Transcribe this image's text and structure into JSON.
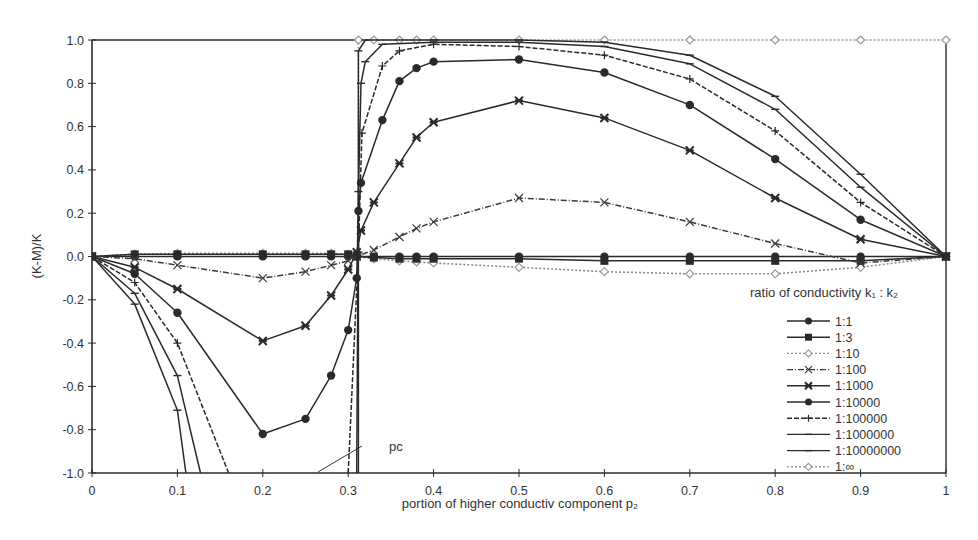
{
  "chart_data": {
    "type": "line",
    "title": "",
    "xlabel": "portion of higher conductiv component  p₂",
    "ylabel": "(K-M)/K",
    "xlim": [
      0,
      1
    ],
    "ylim": [
      -1.0,
      1.0
    ],
    "grid": false,
    "x_ticks": [
      {
        "v": 0,
        "label": "0"
      },
      {
        "v": 0.1,
        "label": "0.1"
      },
      {
        "v": 0.2,
        "label": "0.2"
      },
      {
        "v": 0.3,
        "label": "0.3"
      },
      {
        "v": 0.4,
        "label": "0.4"
      },
      {
        "v": 0.5,
        "label": "0.5"
      },
      {
        "v": 0.6,
        "label": "0.6"
      },
      {
        "v": 0.7,
        "label": "0.7"
      },
      {
        "v": 0.8,
        "label": "0.8"
      },
      {
        "v": 0.9,
        "label": "0.9"
      },
      {
        "v": 1,
        "label": "1"
      }
    ],
    "y_ticks": [
      {
        "v": 1.0,
        "label": "1.0"
      },
      {
        "v": 0.8,
        "label": "0.8"
      },
      {
        "v": 0.6,
        "label": "0.6"
      },
      {
        "v": 0.4,
        "label": "0.4"
      },
      {
        "v": 0.2,
        "label": "0.2"
      },
      {
        "v": 0.0,
        "label": "0.0"
      },
      {
        "v": -0.2,
        "label": "-0.2"
      },
      {
        "v": -0.4,
        "label": "-0.4"
      },
      {
        "v": -0.6,
        "label": "-0.6"
      },
      {
        "v": -0.8,
        "label": "-0.8"
      },
      {
        "v": -1.0,
        "label": "-1.0"
      }
    ],
    "legend": {
      "title": "ratio of conductivity   k₁ : k₂",
      "position": "lower right"
    },
    "annotations": [
      {
        "text": "pᴄ",
        "label": "pc",
        "x": 0.312,
        "y": -1.0,
        "text_x": 0.39,
        "text_y": -0.85
      }
    ],
    "series": [
      {
        "name": "1:1",
        "marker": "circle",
        "line": "solid",
        "color": "#2a2a2a",
        "points": [
          [
            0,
            0
          ],
          [
            0.05,
            0
          ],
          [
            0.1,
            0
          ],
          [
            0.2,
            0
          ],
          [
            0.25,
            0
          ],
          [
            0.28,
            0
          ],
          [
            0.3,
            0
          ],
          [
            0.31,
            0
          ],
          [
            0.33,
            0
          ],
          [
            0.36,
            0
          ],
          [
            0.38,
            0
          ],
          [
            0.4,
            0
          ],
          [
            0.5,
            0
          ],
          [
            0.6,
            0
          ],
          [
            0.7,
            0
          ],
          [
            0.8,
            0
          ],
          [
            0.9,
            0
          ],
          [
            1,
            0
          ]
        ]
      },
      {
        "name": "1:3",
        "marker": "square",
        "line": "solid",
        "color": "#2a2a2a",
        "points": [
          [
            0,
            0
          ],
          [
            0.05,
            0.01
          ],
          [
            0.1,
            0.01
          ],
          [
            0.2,
            0.01
          ],
          [
            0.25,
            0.01
          ],
          [
            0.28,
            0.01
          ],
          [
            0.3,
            0.01
          ],
          [
            0.31,
            0
          ],
          [
            0.33,
            -0.005
          ],
          [
            0.36,
            -0.01
          ],
          [
            0.38,
            -0.01
          ],
          [
            0.4,
            -0.01
          ],
          [
            0.5,
            -0.01
          ],
          [
            0.6,
            -0.02
          ],
          [
            0.7,
            -0.02
          ],
          [
            0.8,
            -0.02
          ],
          [
            0.9,
            -0.02
          ],
          [
            1,
            0
          ]
        ]
      },
      {
        "name": "1:10",
        "marker": "diamond-light",
        "line": "dotted",
        "color": "#8a8a8a",
        "points": [
          [
            0,
            0
          ],
          [
            0.05,
            0.01
          ],
          [
            0.1,
            0.015
          ],
          [
            0.2,
            0.015
          ],
          [
            0.25,
            0.015
          ],
          [
            0.28,
            0.015
          ],
          [
            0.3,
            0.01
          ],
          [
            0.31,
            0
          ],
          [
            0.33,
            -0.01
          ],
          [
            0.36,
            -0.02
          ],
          [
            0.38,
            -0.025
          ],
          [
            0.4,
            -0.03
          ],
          [
            0.5,
            -0.05
          ],
          [
            0.6,
            -0.07
          ],
          [
            0.7,
            -0.08
          ],
          [
            0.8,
            -0.08
          ],
          [
            0.9,
            -0.05
          ],
          [
            1,
            0
          ]
        ]
      },
      {
        "name": "1:100",
        "marker": "x",
        "line": "dashdot",
        "color": "#3a3a3a",
        "points": [
          [
            0,
            0
          ],
          [
            0.05,
            -0.01
          ],
          [
            0.1,
            -0.04
          ],
          [
            0.2,
            -0.1
          ],
          [
            0.25,
            -0.07
          ],
          [
            0.28,
            -0.04
          ],
          [
            0.3,
            -0.02
          ],
          [
            0.31,
            0
          ],
          [
            0.33,
            0.03
          ],
          [
            0.36,
            0.09
          ],
          [
            0.38,
            0.13
          ],
          [
            0.4,
            0.16
          ],
          [
            0.5,
            0.27
          ],
          [
            0.6,
            0.25
          ],
          [
            0.7,
            0.16
          ],
          [
            0.8,
            0.06
          ],
          [
            0.9,
            -0.03
          ],
          [
            1,
            0
          ]
        ]
      },
      {
        "name": "1:1000",
        "marker": "star-x",
        "line": "solid",
        "color": "#2a2a2a",
        "points": [
          [
            0,
            0
          ],
          [
            0.05,
            -0.05
          ],
          [
            0.1,
            -0.15
          ],
          [
            0.2,
            -0.39
          ],
          [
            0.25,
            -0.32
          ],
          [
            0.28,
            -0.18
          ],
          [
            0.3,
            -0.06
          ],
          [
            0.31,
            0.02
          ],
          [
            0.315,
            0.12
          ],
          [
            0.33,
            0.25
          ],
          [
            0.36,
            0.43
          ],
          [
            0.38,
            0.55
          ],
          [
            0.4,
            0.62
          ],
          [
            0.5,
            0.72
          ],
          [
            0.6,
            0.64
          ],
          [
            0.7,
            0.49
          ],
          [
            0.8,
            0.27
          ],
          [
            0.9,
            0.08
          ],
          [
            1,
            0
          ]
        ]
      },
      {
        "name": "1:10000",
        "marker": "dot",
        "line": "solid",
        "color": "#2a2a2a",
        "points": [
          [
            0,
            0
          ],
          [
            0.05,
            -0.08
          ],
          [
            0.1,
            -0.26
          ],
          [
            0.2,
            -0.82
          ],
          [
            0.25,
            -0.75
          ],
          [
            0.28,
            -0.55
          ],
          [
            0.3,
            -0.34
          ],
          [
            0.31,
            -0.1
          ],
          [
            0.312,
            0.21
          ],
          [
            0.315,
            0.34
          ],
          [
            0.34,
            0.63
          ],
          [
            0.36,
            0.81
          ],
          [
            0.38,
            0.87
          ],
          [
            0.4,
            0.9
          ],
          [
            0.5,
            0.91
          ],
          [
            0.6,
            0.85
          ],
          [
            0.7,
            0.7
          ],
          [
            0.8,
            0.45
          ],
          [
            0.9,
            0.17
          ],
          [
            1,
            0
          ]
        ]
      },
      {
        "name": "1:100000",
        "marker": "plus",
        "line": "dashed-light",
        "color": "#2a2a2a",
        "points": [
          [
            0,
            0
          ],
          [
            0.05,
            -0.12
          ],
          [
            0.1,
            -0.4
          ],
          [
            0.16,
            -1.0
          ],
          null,
          [
            0.3,
            -1.0
          ],
          [
            0.312,
            0.02
          ],
          [
            0.316,
            0.57
          ],
          [
            0.34,
            0.88
          ],
          [
            0.36,
            0.95
          ],
          [
            0.4,
            0.98
          ],
          [
            0.5,
            0.97
          ],
          [
            0.6,
            0.93
          ],
          [
            0.7,
            0.82
          ],
          [
            0.8,
            0.58
          ],
          [
            0.9,
            0.25
          ],
          [
            1,
            0
          ]
        ]
      },
      {
        "name": "1:1000000",
        "marker": "dash",
        "line": "solid",
        "color": "#2a2a2a",
        "points": [
          [
            0,
            0
          ],
          [
            0.05,
            -0.17
          ],
          [
            0.1,
            -0.55
          ],
          [
            0.127,
            -1.0
          ],
          null,
          [
            0.31,
            -1.0
          ],
          [
            0.312,
            0.3
          ],
          [
            0.315,
            0.8
          ],
          [
            0.32,
            0.9
          ],
          [
            0.34,
            0.98
          ],
          [
            0.4,
            0.99
          ],
          [
            0.5,
            0.99
          ],
          [
            0.6,
            0.97
          ],
          [
            0.7,
            0.89
          ],
          [
            0.8,
            0.68
          ],
          [
            0.9,
            0.32
          ],
          [
            1,
            0
          ]
        ]
      },
      {
        "name": "1:10000000",
        "marker": "dash",
        "line": "solid",
        "color": "#2a2a2a",
        "points": [
          [
            0,
            0
          ],
          [
            0.05,
            -0.22
          ],
          [
            0.1,
            -0.71
          ],
          [
            0.11,
            -1.0
          ],
          null,
          [
            0.312,
            -1.0
          ],
          [
            0.312,
            0.95
          ],
          [
            0.32,
            1.0
          ],
          [
            0.4,
            1.0
          ],
          [
            0.5,
            1.0
          ],
          [
            0.6,
            0.99
          ],
          [
            0.7,
            0.93
          ],
          [
            0.8,
            0.74
          ],
          [
            0.9,
            0.38
          ],
          [
            1,
            0
          ]
        ]
      },
      {
        "name": "1:∞",
        "marker": "diamond-light",
        "line": "dotted",
        "color": "#9a9a9a",
        "points": [
          [
            0,
            0
          ],
          [
            0.05,
            0.01
          ],
          [
            0.1,
            0.01
          ],
          [
            0.2,
            0.01
          ],
          [
            0.25,
            0.01
          ],
          [
            0.28,
            0.01
          ],
          [
            0.3,
            0.01
          ],
          [
            0.312,
            0.01
          ],
          [
            0.312,
            1.0
          ],
          [
            0.33,
            1.0
          ],
          [
            0.36,
            1.0
          ],
          [
            0.38,
            1.0
          ],
          [
            0.4,
            1.0
          ],
          [
            0.5,
            1.0
          ],
          [
            0.6,
            1.0
          ],
          [
            0.7,
            1.0
          ],
          [
            0.8,
            1.0
          ],
          [
            0.9,
            1.0
          ],
          [
            1,
            1.0
          ]
        ]
      }
    ]
  },
  "legend_items": [
    {
      "label": "1:1"
    },
    {
      "label": "1:3"
    },
    {
      "label": "1:10"
    },
    {
      "label": "1:100"
    },
    {
      "label": "1:1000"
    },
    {
      "label": "1:10000"
    },
    {
      "label": "1:100000"
    },
    {
      "label": "1:1000000"
    },
    {
      "label": "1:10000000"
    },
    {
      "label": "1:∞"
    }
  ],
  "axis": {
    "x_title": "portion of higher conductiv component  p₂",
    "y_title": "(K-M)/K"
  },
  "legend_title": "ratio of conductivity   k₁ : k₂",
  "annotation_pc": "pᴄ"
}
